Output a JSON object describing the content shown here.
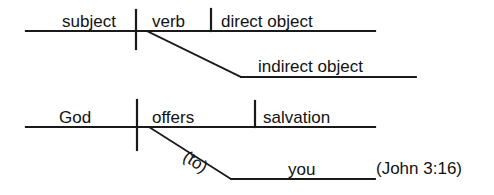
{
  "figure": {
    "background_color": "#ffffff",
    "line_color": "#1a1a1a",
    "text_color": "#121212"
  },
  "template_diagram": {
    "name": "generic-pattern",
    "subject": "subject",
    "verb": "verb",
    "direct_object": "direct object",
    "indirect_object": "indirect object"
  },
  "example_diagram": {
    "name": "john-3-16-example",
    "subject": "God",
    "verb": "offers",
    "direct_object": "salvation",
    "preposition": "(to)",
    "indirect_object": "you",
    "citation": "(John 3:16)"
  }
}
